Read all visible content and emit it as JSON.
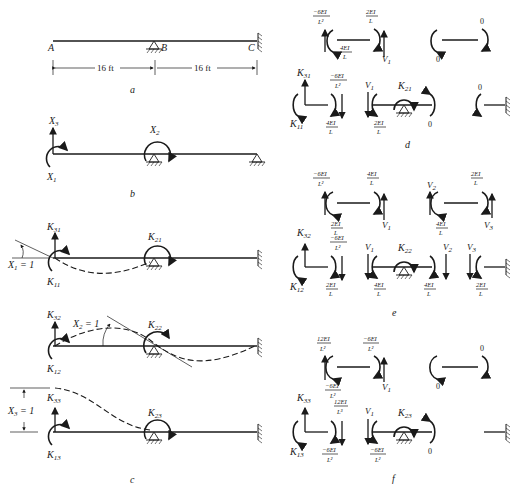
{
  "figure": {
    "panels": {
      "a": {
        "caption": "a",
        "points": [
          "A",
          "B",
          "C"
        ],
        "dimensions": [
          "16 ft",
          "16 ft"
        ],
        "supports": {
          "B": "pin",
          "C": "fixed"
        }
      },
      "b": {
        "caption": "b",
        "labels": {
          "x3": "X",
          "x3_sub": "3",
          "x2": "X",
          "x2_sub": "2",
          "x1": "X",
          "x1_sub": "1"
        }
      },
      "c": {
        "caption": "c",
        "case1": {
          "k31": "K",
          "k31_sub": "31",
          "k21": "K",
          "k21_sub": "21",
          "k11": "K",
          "k11_sub": "11",
          "disp": "X",
          "disp_sub": "1",
          "disp_val": " = 1"
        },
        "case2": {
          "k32": "K",
          "k32_sub": "32",
          "k22": "K",
          "k22_sub": "22",
          "k12": "K",
          "k12_sub": "12",
          "disp": "X",
          "disp_sub": "2",
          "disp_val": " = 1"
        },
        "case3": {
          "k33": "K",
          "k33_sub": "33",
          "k23": "K",
          "k23_sub": "23",
          "k13": "K",
          "k13_sub": "13",
          "disp": "X",
          "disp_sub": "3",
          "disp_val": " = 1"
        }
      },
      "d": {
        "caption": "d",
        "member_ab": {
          "left_shear_num": "−6EI",
          "left_shear_den": "L²",
          "left_moment_num": "4EI",
          "left_moment_den": "L",
          "right_moment_num": "2EI",
          "right_moment_den": "L",
          "right_shear": "V",
          "right_shear_sub": "1"
        },
        "member_bc": {
          "left_moment": "0",
          "right_moment": "0"
        },
        "joint_a": {
          "k31": "K",
          "k31_sub": "31",
          "k11": "K",
          "k11_sub": "11",
          "shear_num": "−6EI",
          "shear_den": "L²",
          "moment_num": "4EI",
          "moment_den": "L"
        },
        "joint_b": {
          "shear": "V",
          "shear_sub": "1",
          "k21": "K",
          "k21_sub": "21",
          "left_moment_num": "2EI",
          "left_moment_den": "L",
          "right_moment": "0"
        },
        "joint_c": {
          "moment": "0"
        }
      },
      "e": {
        "caption": "e",
        "member_ab": {
          "left_shear_num": "−6EI",
          "left_shear_den": "L²",
          "left_moment_num": "2EI",
          "left_moment_den": "L",
          "right_moment_num": "4EI",
          "right_moment_den": "L",
          "right_shear": "V",
          "right_shear_sub": "1"
        },
        "member_bc": {
          "left_shear": "V",
          "left_shear_sub": "2",
          "left_moment_num": "4EI",
          "left_moment_den": "L",
          "right_moment_num": "2EI",
          "right_moment_den": "L",
          "right_shear": "V",
          "right_shear_sub": "3"
        },
        "joint_a": {
          "k32": "K",
          "k32_sub": "32",
          "k12": "K",
          "k12_sub": "12",
          "shear_num": "−6EI",
          "shear_den": "L²",
          "moment_num": "2EI",
          "moment_den": "L"
        },
        "joint_b": {
          "v1": "V",
          "v1_sub": "1",
          "k22": "K",
          "k22_sub": "22",
          "left_moment_num": "4EI",
          "left_moment_den": "L",
          "right_moment_num": "4EI",
          "right_moment_den": "L",
          "v2": "V",
          "v2_sub": "2"
        },
        "joint_c": {
          "v3": "V",
          "v3_sub": "3",
          "moment_num": "2EI",
          "moment_den": "L"
        }
      },
      "f": {
        "caption": "f",
        "member_ab": {
          "left_shear_num": "12EI",
          "left_shear_den": "L²",
          "left_moment_num": "−6EI",
          "left_moment_den": "L²",
          "right_moment_num": "−6EI",
          "right_moment_den": "L²",
          "right_shear": "V",
          "right_shear_sub": "1"
        },
        "member_bc": {
          "left_moment": "0",
          "right_moment": "0"
        },
        "joint_a": {
          "k33": "K",
          "k33_sub": "33",
          "k13": "K",
          "k13_sub": "13",
          "shear_num": "12EI",
          "shear_den": "L³",
          "moment_num": "−6EI",
          "moment_den": "L²"
        },
        "joint_b": {
          "v1": "V",
          "v1_sub": "1",
          "k23": "K",
          "k23_sub": "23",
          "left_moment_num": "−6EI",
          "left_moment_den": "L²",
          "right_moment": "0"
        }
      }
    }
  }
}
